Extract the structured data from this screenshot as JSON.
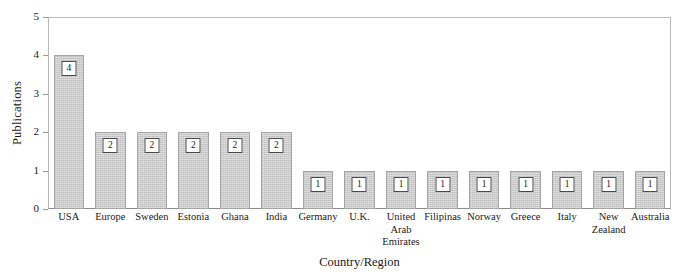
{
  "chart_data": {
    "type": "bar",
    "title": "",
    "xlabel": "Country/Region",
    "ylabel": "Publications",
    "categories": [
      "USA",
      "Europe",
      "Sweden",
      "Estonia",
      "Ghana",
      "India",
      "Germany",
      "U.K.",
      "United Arab Emirates",
      "Filipinas",
      "Norway",
      "Greece",
      "Italy",
      "New Zealand",
      "Australia"
    ],
    "category_lines": [
      [
        "USA"
      ],
      [
        "Europe"
      ],
      [
        "Sweden"
      ],
      [
        "Estonia"
      ],
      [
        "Ghana"
      ],
      [
        "India"
      ],
      [
        "Germany"
      ],
      [
        "U.K."
      ],
      [
        "United",
        "Arab",
        "Emirates"
      ],
      [
        "Filipinas"
      ],
      [
        "Norway"
      ],
      [
        "Greece"
      ],
      [
        "Italy"
      ],
      [
        "New",
        "Zealand"
      ],
      [
        "Australia"
      ]
    ],
    "values": [
      4,
      2,
      2,
      2,
      2,
      2,
      1,
      1,
      1,
      1,
      1,
      1,
      1,
      1,
      1
    ],
    "data_labels": [
      "4",
      "2",
      "2",
      "2",
      "2",
      "2",
      "1",
      "1",
      "1",
      "1",
      "1",
      "1",
      "1",
      "1",
      "1"
    ],
    "ylim": [
      0,
      5
    ],
    "yticks": [
      0,
      1,
      2,
      3,
      4,
      5
    ],
    "ytick_labels": [
      "0",
      "1",
      "2",
      "3",
      "4",
      "5"
    ],
    "grid": false,
    "legend": null,
    "bar_color": "#cccccc",
    "bar_edge_color": "#a5a5a5",
    "axis_color": "#8d8d8d",
    "text_color": "#1a1a1a"
  }
}
